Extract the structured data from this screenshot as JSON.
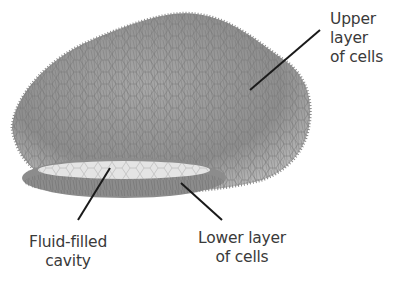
{
  "diagram": {
    "labels": {
      "upper": {
        "lines": [
          "Upper",
          "layer",
          "of cells"
        ]
      },
      "cavity": {
        "lines": [
          "Fluid-filled",
          "cavity"
        ]
      },
      "lower": {
        "lines": [
          "Lower layer",
          "of cells"
        ]
      }
    },
    "colors": {
      "body_fill": "#9a9a9a",
      "body_dark": "#6f6f6f",
      "cavity_fill": "#e4e4e4",
      "leader_line": "#1a1a1a",
      "label_text": "#3a3a3a"
    }
  }
}
